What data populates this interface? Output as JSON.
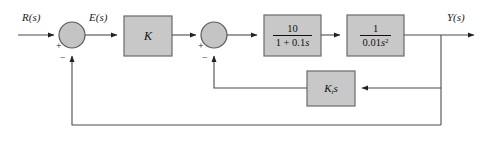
{
  "diagram": {
    "kind": "control-system-block-diagram",
    "colors": {
      "block_fill": "#c8c8c8",
      "block_stroke": "#6b6b6b",
      "line": "#4d4d4d",
      "text": "#111111",
      "background": "#ffffff"
    },
    "signals": {
      "input": "R(s)",
      "error": "E(s)",
      "output": "Y(s)"
    },
    "summing_junctions": [
      {
        "id": "sum1",
        "name": "input-summing-junction",
        "input_sign": "+",
        "feedback_sign": "−",
        "cx": 72,
        "cy": 35,
        "r": 13
      },
      {
        "id": "sum2",
        "name": "inner-loop-summing-junction",
        "input_sign": "+",
        "feedback_sign": "−",
        "cx": 214,
        "cy": 35,
        "r": 13
      }
    ],
    "blocks": [
      {
        "id": "gain",
        "name": "gain-block-k",
        "label": "K",
        "kind": "gain",
        "x": 124,
        "y": 16,
        "w": 48,
        "h": 40
      },
      {
        "id": "lag",
        "name": "first-order-lag-block",
        "kind": "fraction",
        "numerator": "10",
        "denominator": "1 + 0.1s",
        "label": "10 / (1 + 0.1s)",
        "x": 264,
        "y": 15,
        "w": 57,
        "h": 41
      },
      {
        "id": "plant",
        "name": "double-integrator-block",
        "kind": "fraction",
        "numerator": "1",
        "denominator": "0.01s²",
        "label": "1 / (0.01s^2)",
        "x": 347,
        "y": 15,
        "w": 57,
        "h": 41
      },
      {
        "id": "tach",
        "name": "tachometer-feedback-block",
        "kind": "gain",
        "label": "K_t s",
        "x": 307,
        "y": 71,
        "w": 48,
        "h": 35
      }
    ],
    "paths": [
      {
        "name": "input-path",
        "from": "R(s)",
        "to": "sum1"
      },
      {
        "name": "error-path",
        "from": "sum1",
        "to": "gain"
      },
      {
        "name": "gain-to-sum2-path",
        "from": "gain",
        "to": "sum2"
      },
      {
        "name": "sum2-to-lag-path",
        "from": "sum2",
        "to": "lag"
      },
      {
        "name": "lag-to-plant-path",
        "from": "lag",
        "to": "plant"
      },
      {
        "name": "plant-to-output-path",
        "from": "plant",
        "to": "Y(s)"
      },
      {
        "name": "inner-feedback-path",
        "from": "output-tap",
        "to": "tach"
      },
      {
        "name": "tach-to-sum2-path",
        "from": "tach",
        "to": "sum2"
      },
      {
        "name": "outer-feedback-path",
        "from": "output-tap",
        "to": "sum1"
      }
    ]
  }
}
